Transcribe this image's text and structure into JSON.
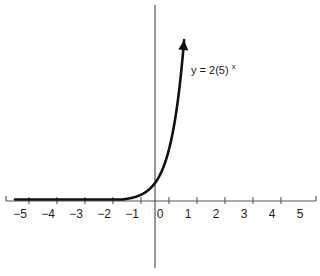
{
  "chart_data": {
    "type": "line",
    "title": "",
    "xlabel": "",
    "ylabel": "",
    "function": "y = 2(5)^x",
    "base": 5,
    "coefficient": 2,
    "x_domain": [
      -5,
      1.04
    ],
    "xlim": [
      -5.5,
      5.5
    ],
    "x_ticks": [
      -5,
      -4,
      -3,
      -2,
      -1,
      0,
      1,
      2,
      3,
      4,
      5
    ],
    "x_tick_labels": [
      "−5",
      "−4",
      "−3",
      "−2",
      "−1",
      "0",
      "1",
      "2",
      "3",
      "4",
      "5"
    ],
    "y_intercept": 2,
    "grid": false,
    "arrow_at_end": true,
    "annotation": {
      "text_main": "y = 2(5)",
      "text_sup": "x"
    },
    "colors": {
      "curve": "#111111",
      "axis": "#555555"
    }
  }
}
